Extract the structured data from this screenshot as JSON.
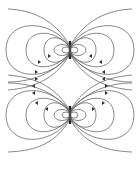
{
  "figure": {
    "diagrams": [
      {
        "name": "upper-dipole",
        "center": [
          70,
          50
        ],
        "arrow_direction": "toward-center-top"
      },
      {
        "name": "lower-dipole",
        "center": [
          70,
          115
        ],
        "arrow_direction": "away-from-center"
      }
    ],
    "colors": {
      "line": "#555555",
      "arrow": "#333333",
      "magnet": "#222222",
      "background": "#ffffff"
    }
  }
}
